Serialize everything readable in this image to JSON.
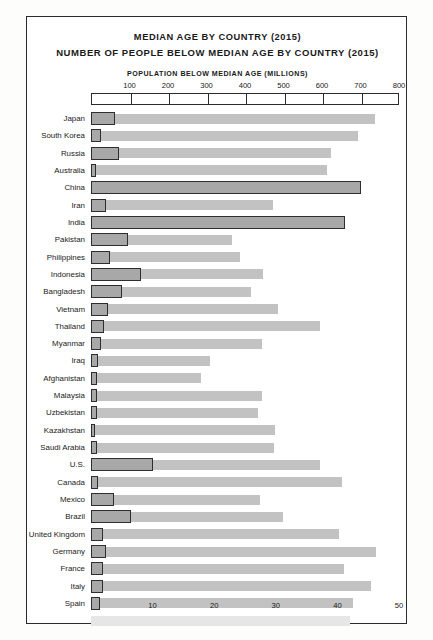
{
  "title": {
    "line1": "MEDIAN AGE BY COUNTRY (2015)",
    "line2": "NUMBER OF PEOPLE BELOW MEDIAN AGE BY COUNTRY (2015)"
  },
  "top_axis_caption": "POPULATION BELOW MEDIAN AGE (MILLIONS)",
  "bottom_axis_caption": "MEDIAN AGE (YEARS)",
  "chart_data": {
    "type": "bar",
    "orientation": "horizontal",
    "grid": false,
    "legend": "none",
    "top_axis": {
      "label": "POPULATION BELOW MEDIAN AGE (MILLIONS)",
      "ticks": [
        0,
        100,
        200,
        300,
        400,
        500,
        600,
        700,
        800
      ],
      "tick_labels": [
        "",
        "100",
        "200",
        "300",
        "400",
        "500",
        "600",
        "700",
        "800"
      ],
      "range": [
        0,
        800
      ]
    },
    "bottom_axis": {
      "label": "MEDIAN AGE (YEARS)",
      "ticks": [
        10,
        20,
        30,
        40,
        50
      ],
      "tick_labels": [
        "10",
        "20",
        "30",
        "40",
        "50"
      ],
      "range": [
        0,
        50
      ]
    },
    "categories": [
      "Japan",
      "South Korea",
      "Russia",
      "Australia",
      "China",
      "Iran",
      "India",
      "Pakistan",
      "Philippines",
      "Indonesia",
      "Bangladesh",
      "Vietnam",
      "Thailand",
      "Myanmar",
      "Iraq",
      "Afghanistan",
      "Malaysia",
      "Uzbekistan",
      "Kazakhstan",
      "Saudi Arabia",
      "U.S.",
      "Canada",
      "Mexico",
      "Brazil",
      "United Kingdom",
      "Germany",
      "France",
      "Italy",
      "Spain"
    ],
    "series": [
      {
        "name": "Median age (years)",
        "axis": "bottom",
        "units": "years",
        "values": [
          46.1,
          43.4,
          39.0,
          38.3,
          36.8,
          29.5,
          27.0,
          22.9,
          24.2,
          28.0,
          26.0,
          30.4,
          37.2,
          27.7,
          19.3,
          17.8,
          27.7,
          27.1,
          29.9,
          29.7,
          37.2,
          40.8,
          27.4,
          31.2,
          40.2,
          46.2,
          41.1,
          45.5,
          42.6
        ]
      },
      {
        "name": "Population below median age (millions)",
        "axis": "top",
        "units": "millions",
        "values": [
          63,
          25,
          72,
          12,
          700,
          40,
          660,
          95,
          50,
          130,
          80,
          45,
          34,
          26,
          18,
          16,
          15,
          16,
          9,
          16,
          160,
          18,
          61,
          103,
          32,
          40,
          32,
          30,
          23
        ]
      }
    ]
  }
}
